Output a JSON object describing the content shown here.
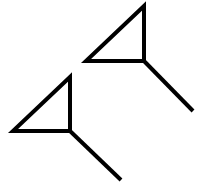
{
  "canvas": {
    "width": 202,
    "height": 193,
    "background": "#ffffff"
  },
  "stroke": {
    "color": "#000000",
    "width": 4
  },
  "shapes": [
    {
      "name": "arrow-glyph-top-right",
      "triangle": [
        [
          144,
          6
        ],
        [
          86,
          61
        ],
        [
          144,
          61
        ]
      ],
      "tail": [
        [
          144,
          61
        ],
        [
          193,
          111
        ]
      ]
    },
    {
      "name": "arrow-glyph-bottom-left",
      "triangle": [
        [
          70,
          77
        ],
        [
          13,
          131
        ],
        [
          70,
          131
        ]
      ],
      "tail": [
        [
          70,
          131
        ],
        [
          121,
          180
        ]
      ]
    }
  ]
}
